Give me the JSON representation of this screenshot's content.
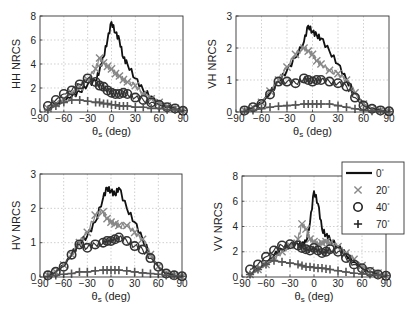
{
  "chart_data": [
    {
      "type": "line",
      "title": "",
      "panel": "top-left",
      "xlabel": "θs (deg)",
      "ylabel": "HH NRCS",
      "xlim": [
        -90,
        90
      ],
      "ylim": [
        0,
        8
      ],
      "xticks": [
        -90,
        -60,
        -30,
        0,
        30,
        60,
        90
      ],
      "yticks": [
        0,
        2,
        4,
        6,
        8
      ],
      "grid": true,
      "box": {
        "x": 40,
        "y": 16,
        "w": 143,
        "h": 96
      },
      "x": [
        -80,
        -70,
        -60,
        -50,
        -40,
        -30,
        -20,
        -15,
        -10,
        -5,
        0,
        5,
        10,
        15,
        20,
        30,
        40,
        50,
        60,
        70,
        80,
        90
      ],
      "series": [
        {
          "name": "0°",
          "marker": "line",
          "color": "#111111",
          "values": [
            0.3,
            0.6,
            1.0,
            1.3,
            1.7,
            2.3,
            2.6,
            3.5,
            4.6,
            6.0,
            7.5,
            6.6,
            6.0,
            4.5,
            4.0,
            2.8,
            1.8,
            1.3,
            0.8,
            0.5,
            0.3,
            0.1
          ]
        },
        {
          "name": "20°",
          "marker": "x",
          "color": "#888888",
          "values": [
            0.3,
            0.7,
            1.1,
            1.6,
            2.1,
            2.7,
            3.6,
            4.5,
            4.1,
            3.8,
            3.6,
            3.2,
            3.0,
            2.7,
            2.5,
            2.2,
            1.5,
            1.1,
            0.8,
            0.5,
            0.3,
            0.1
          ]
        },
        {
          "name": "40°",
          "marker": "o",
          "color": "#333333",
          "values": [
            0.5,
            1.0,
            1.5,
            1.8,
            2.3,
            2.8,
            2.5,
            2.2,
            2.1,
            1.8,
            1.6,
            1.5,
            1.5,
            1.6,
            1.5,
            1.2,
            1.0,
            0.8,
            0.6,
            0.4,
            0.3,
            0.1
          ]
        },
        {
          "name": "70°",
          "marker": "+",
          "color": "#555555",
          "values": [
            0.2,
            0.5,
            0.8,
            1.0,
            1.0,
            0.9,
            0.8,
            0.8,
            0.7,
            0.7,
            0.6,
            0.6,
            0.5,
            0.5,
            0.5,
            0.4,
            0.4,
            0.3,
            0.3,
            0.2,
            0.2,
            0.1
          ]
        }
      ]
    },
    {
      "type": "line",
      "title": "",
      "panel": "top-right",
      "xlabel": "θs (deg)",
      "ylabel": "VH NRCS",
      "xlim": [
        -90,
        90
      ],
      "ylim": [
        0,
        3
      ],
      "xticks": [
        -90,
        -60,
        -30,
        0,
        30,
        60,
        90
      ],
      "yticks": [
        0,
        1,
        2,
        3
      ],
      "grid": true,
      "box": {
        "x": 236,
        "y": 16,
        "w": 153,
        "h": 96
      },
      "x": [
        -80,
        -70,
        -60,
        -50,
        -40,
        -30,
        -20,
        -10,
        -5,
        0,
        5,
        10,
        20,
        30,
        40,
        50,
        60,
        70,
        80,
        90
      ],
      "series": [
        {
          "name": "0°",
          "marker": "line",
          "color": "#111111",
          "values": [
            0.05,
            0.15,
            0.3,
            0.6,
            0.95,
            1.3,
            1.7,
            2.2,
            2.7,
            2.5,
            2.4,
            2.3,
            1.9,
            1.5,
            1.0,
            0.6,
            0.25,
            0.1,
            0.05,
            0.02
          ]
        },
        {
          "name": "20°",
          "marker": "x",
          "color": "#888888",
          "values": [
            0.05,
            0.15,
            0.3,
            0.65,
            1.0,
            1.4,
            1.8,
            2.0,
            1.9,
            1.8,
            1.6,
            1.5,
            1.3,
            1.2,
            1.0,
            0.6,
            0.25,
            0.1,
            0.05,
            0.02
          ]
        },
        {
          "name": "40°",
          "marker": "o",
          "color": "#333333",
          "values": [
            0.05,
            0.15,
            0.25,
            0.55,
            0.95,
            0.95,
            0.9,
            1.05,
            1.0,
            0.95,
            1.0,
            1.0,
            0.95,
            0.9,
            0.8,
            0.45,
            0.2,
            0.1,
            0.05,
            0.02
          ]
        },
        {
          "name": "70°",
          "marker": "+",
          "color": "#555555",
          "values": [
            0.02,
            0.05,
            0.1,
            0.15,
            0.18,
            0.2,
            0.22,
            0.25,
            0.25,
            0.25,
            0.25,
            0.25,
            0.25,
            0.2,
            0.15,
            0.1,
            0.05,
            0.03,
            0.02,
            0.01
          ]
        }
      ]
    },
    {
      "type": "line",
      "title": "",
      "panel": "bottom-left",
      "xlabel": "θs (deg)",
      "ylabel": "HV NRCS",
      "xlim": [
        -90,
        90
      ],
      "ylim": [
        0,
        3
      ],
      "xticks": [
        -90,
        -60,
        -30,
        0,
        30,
        60,
        90
      ],
      "yticks": [
        0,
        1,
        2,
        3
      ],
      "grid": true,
      "box": {
        "x": 40,
        "y": 174,
        "w": 142,
        "h": 103
      },
      "x": [
        -80,
        -70,
        -60,
        -50,
        -40,
        -30,
        -20,
        -10,
        -5,
        0,
        5,
        10,
        20,
        30,
        40,
        50,
        60,
        70,
        80,
        90
      ],
      "series": [
        {
          "name": "0°",
          "marker": "line",
          "color": "#111111",
          "values": [
            0.05,
            0.15,
            0.35,
            0.65,
            1.0,
            1.2,
            1.6,
            2.3,
            2.6,
            2.5,
            2.4,
            2.6,
            2.0,
            1.6,
            1.1,
            0.65,
            0.3,
            0.1,
            0.05,
            0.02
          ]
        },
        {
          "name": "20°",
          "marker": "x",
          "color": "#888888",
          "values": [
            0.05,
            0.15,
            0.35,
            0.65,
            1.0,
            1.3,
            1.8,
            1.9,
            1.7,
            1.6,
            1.55,
            1.5,
            1.5,
            1.3,
            1.1,
            0.65,
            0.3,
            0.1,
            0.05,
            0.02
          ]
        },
        {
          "name": "40°",
          "marker": "o",
          "color": "#333333",
          "values": [
            0.05,
            0.15,
            0.3,
            0.65,
            0.95,
            0.85,
            0.95,
            1.0,
            1.05,
            1.05,
            1.1,
            1.15,
            1.05,
            0.9,
            0.8,
            0.55,
            0.3,
            0.1,
            0.05,
            0.02
          ]
        },
        {
          "name": "70°",
          "marker": "+",
          "color": "#555555",
          "values": [
            0.02,
            0.05,
            0.08,
            0.1,
            0.15,
            0.15,
            0.18,
            0.2,
            0.2,
            0.2,
            0.2,
            0.2,
            0.18,
            0.15,
            0.12,
            0.1,
            0.08,
            0.05,
            0.03,
            0.02
          ]
        }
      ]
    },
    {
      "type": "line",
      "title": "",
      "panel": "bottom-right",
      "xlabel": "θs (deg)",
      "ylabel": "VV NRCS",
      "xlim": [
        -90,
        90
      ],
      "ylim": [
        0,
        8
      ],
      "xticks": [
        -90,
        -60,
        -30,
        0,
        30,
        60,
        90
      ],
      "yticks": [
        0,
        2,
        4,
        6,
        8
      ],
      "grid": true,
      "box": {
        "x": 242,
        "y": 176,
        "w": 144,
        "h": 101
      },
      "x": [
        -80,
        -70,
        -60,
        -50,
        -40,
        -30,
        -20,
        -15,
        -10,
        -5,
        0,
        5,
        10,
        15,
        20,
        30,
        40,
        50,
        60,
        70,
        80,
        90
      ],
      "series": [
        {
          "name": "0°",
          "marker": "line",
          "color": "#111111",
          "values": [
            0.2,
            0.6,
            1.1,
            1.7,
            2.2,
            2.5,
            2.6,
            2.5,
            2.8,
            4.3,
            6.8,
            5.8,
            3.8,
            3.3,
            3.0,
            2.4,
            1.8,
            1.2,
            0.7,
            0.4,
            0.2,
            0.1
          ]
        },
        {
          "name": "20°",
          "marker": "x",
          "color": "#888888",
          "values": [
            0.2,
            0.6,
            1.0,
            1.5,
            2.0,
            2.5,
            3.0,
            4.2,
            3.8,
            3.0,
            2.8,
            2.6,
            2.7,
            2.8,
            2.7,
            2.4,
            1.9,
            1.4,
            0.9,
            0.5,
            0.3,
            0.1
          ]
        },
        {
          "name": "40°",
          "marker": "o",
          "color": "#333333",
          "values": [
            0.6,
            1.0,
            1.6,
            2.1,
            2.5,
            2.6,
            2.5,
            2.3,
            2.2,
            2.1,
            2.3,
            2.1,
            1.9,
            2.0,
            2.2,
            2.0,
            1.5,
            1.0,
            0.7,
            0.4,
            0.2,
            0.1
          ]
        },
        {
          "name": "70°",
          "marker": "+",
          "color": "#555555",
          "values": [
            0.2,
            0.6,
            1.0,
            1.3,
            1.2,
            1.1,
            1.0,
            0.9,
            0.8,
            0.8,
            0.75,
            0.7,
            0.7,
            0.65,
            0.6,
            0.5,
            0.4,
            0.3,
            0.25,
            0.2,
            0.15,
            0.1
          ]
        }
      ]
    }
  ],
  "legend": {
    "box": {
      "x": 342,
      "y": 162,
      "w": 62,
      "h": 72
    },
    "entries": [
      {
        "label": "0°",
        "marker": "line"
      },
      {
        "label": "20°",
        "marker": "x"
      },
      {
        "label": "40°",
        "marker": "o"
      },
      {
        "label": "70°",
        "marker": "+"
      }
    ]
  }
}
